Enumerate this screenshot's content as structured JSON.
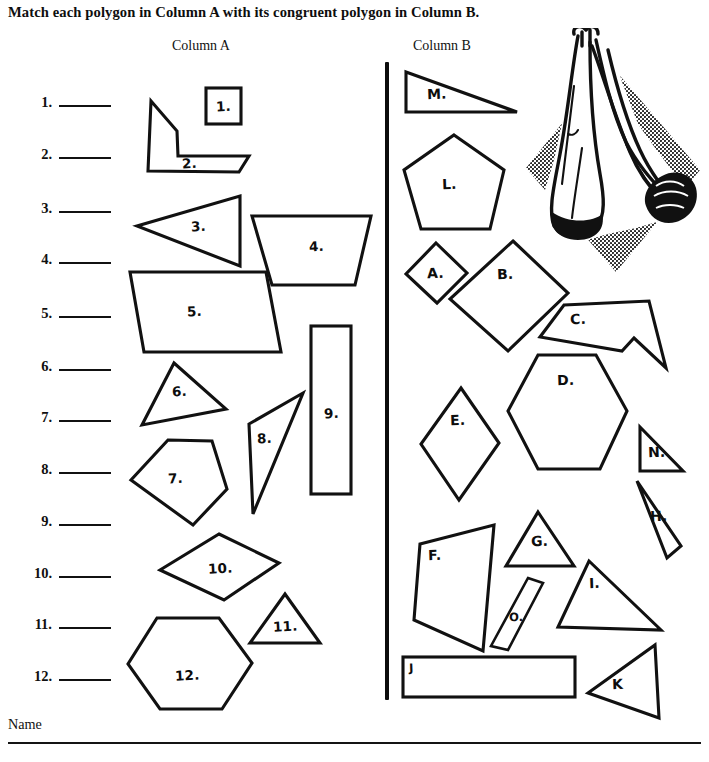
{
  "worksheet": {
    "instruction": "Match each polygon in Column A with its congruent polygon in Column B.",
    "column_a_header": "Column A",
    "column_b_header": "Column B",
    "footer_label": "Name"
  },
  "answers": [
    {
      "number": "1.",
      "value": ""
    },
    {
      "number": "2.",
      "value": ""
    },
    {
      "number": "3.",
      "value": ""
    },
    {
      "number": "4.",
      "value": ""
    },
    {
      "number": "5.",
      "value": ""
    },
    {
      "number": "6.",
      "value": ""
    },
    {
      "number": "7.",
      "value": ""
    },
    {
      "number": "8.",
      "value": ""
    },
    {
      "number": "9.",
      "value": ""
    },
    {
      "number": "10.",
      "value": ""
    },
    {
      "number": "11.",
      "value": ""
    },
    {
      "number": "12.",
      "value": ""
    }
  ],
  "column_a_shapes": [
    {
      "label": "1.",
      "kind": "square"
    },
    {
      "label": "2.",
      "kind": "L-shaped hexagon"
    },
    {
      "label": "3.",
      "kind": "triangle"
    },
    {
      "label": "4.",
      "kind": "trapezoid"
    },
    {
      "label": "5.",
      "kind": "parallelogram"
    },
    {
      "label": "6.",
      "kind": "triangle"
    },
    {
      "label": "7.",
      "kind": "pentagon"
    },
    {
      "label": "8.",
      "kind": "thin triangle"
    },
    {
      "label": "9.",
      "kind": "rectangle"
    },
    {
      "label": "10.",
      "kind": "rhombus"
    },
    {
      "label": "11.",
      "kind": "triangle"
    },
    {
      "label": "12.",
      "kind": "hexagon"
    }
  ],
  "column_b_shapes": [
    {
      "label": "M.",
      "kind": "right triangle"
    },
    {
      "label": "L.",
      "kind": "pentagon"
    },
    {
      "label": "A.",
      "kind": "small square"
    },
    {
      "label": "B.",
      "kind": "square"
    },
    {
      "label": "C.",
      "kind": "L-shaped hexagon"
    },
    {
      "label": "D.",
      "kind": "hexagon"
    },
    {
      "label": "E.",
      "kind": "rhombus"
    },
    {
      "label": "N.",
      "kind": "small triangle"
    },
    {
      "label": "H.",
      "kind": "thin triangle"
    },
    {
      "label": "F.",
      "kind": "quadrilateral"
    },
    {
      "label": "G.",
      "kind": "triangle"
    },
    {
      "label": "O.",
      "kind": "thin parallelogram"
    },
    {
      "label": "I.",
      "kind": "triangle"
    },
    {
      "label": "J",
      "kind": "rectangle"
    },
    {
      "label": "K",
      "kind": "triangle"
    }
  ],
  "clipart": {
    "name": "person-stretching-illustration",
    "description": "Black and white clip art of a person in a stretching pose on a halftone diamond background"
  },
  "colors": {
    "ink": "#111111",
    "paper": "#ffffff"
  }
}
